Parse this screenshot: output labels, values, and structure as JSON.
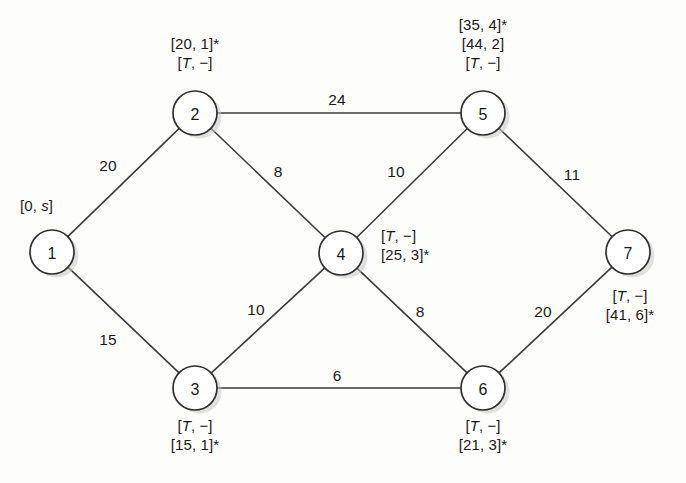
{
  "figure": {
    "type": "weighted-undirected-graph"
  },
  "nodes": [
    {
      "id": "1",
      "label": "1",
      "cx": 52,
      "cy": 252
    },
    {
      "id": "2",
      "label": "2",
      "cx": 195,
      "cy": 113
    },
    {
      "id": "3",
      "label": "3",
      "cx": 195,
      "cy": 388
    },
    {
      "id": "4",
      "label": "4",
      "cx": 341,
      "cy": 253
    },
    {
      "id": "5",
      "label": "5",
      "cx": 483,
      "cy": 113
    },
    {
      "id": "6",
      "label": "6",
      "cx": 483,
      "cy": 388
    },
    {
      "id": "7",
      "label": "7",
      "cx": 628,
      "cy": 252
    }
  ],
  "edges": [
    {
      "from": "1",
      "to": "2",
      "weight": "20",
      "wx": 108,
      "wy": 166
    },
    {
      "from": "1",
      "to": "3",
      "weight": "15",
      "wx": 108,
      "wy": 340
    },
    {
      "from": "2",
      "to": "5",
      "weight": "24",
      "wx": 337,
      "wy": 100
    },
    {
      "from": "2",
      "to": "4",
      "weight": "8",
      "wx": 278,
      "wy": 172
    },
    {
      "from": "4",
      "to": "5",
      "weight": "10",
      "wx": 396,
      "wy": 172
    },
    {
      "from": "3",
      "to": "4",
      "weight": "10",
      "wx": 256,
      "wy": 310
    },
    {
      "from": "4",
      "to": "6",
      "weight": "8",
      "wx": 420,
      "wy": 312
    },
    {
      "from": "3",
      "to": "6",
      "weight": "6",
      "wx": 337,
      "wy": 376
    },
    {
      "from": "5",
      "to": "7",
      "weight": "11",
      "wx": 572,
      "wy": 175
    },
    {
      "from": "6",
      "to": "7",
      "weight": "20",
      "wx": 543,
      "wy": 312
    }
  ],
  "node_labels": [
    {
      "node": "1",
      "align": "left",
      "x": 20,
      "y": 196,
      "lines": [
        "[0, s]"
      ]
    },
    {
      "node": "2",
      "align": "center",
      "x": 195,
      "y": 34,
      "lines": [
        "[20, 1]*",
        "[T, −]"
      ]
    },
    {
      "node": "3",
      "align": "center",
      "x": 195,
      "y": 416,
      "lines": [
        "[T, −]",
        "[15, 1]*"
      ]
    },
    {
      "node": "4",
      "align": "left",
      "x": 381,
      "y": 226,
      "lines": [
        "[T, −]",
        "[25, 3]*"
      ]
    },
    {
      "node": "5",
      "align": "center",
      "x": 483,
      "y": 15,
      "lines": [
        "[35, 4]*",
        "[44, 2]",
        "[T, −]"
      ]
    },
    {
      "node": "6",
      "align": "center",
      "x": 483,
      "y": 416,
      "lines": [
        "[T, −]",
        "[21, 3]*"
      ]
    },
    {
      "node": "7",
      "align": "center",
      "x": 630,
      "y": 286,
      "lines": [
        "[T, −]",
        "[41, 6]*"
      ]
    }
  ],
  "style": {
    "node_radius": 22,
    "stroke_color": "#2f2f2f",
    "text_color": "#1a1a1a",
    "background": "#fdfdfc",
    "shadow_color": "#c9c9c9"
  }
}
